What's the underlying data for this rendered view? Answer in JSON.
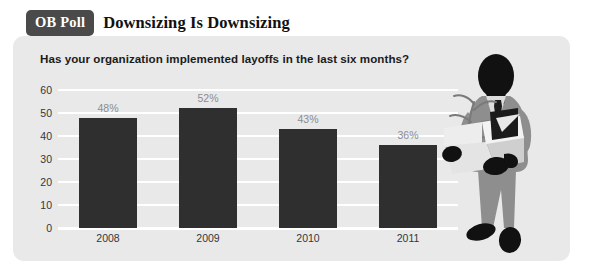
{
  "header": {
    "badge_label": "OB Poll",
    "headline": "Downsizing Is Downsizing"
  },
  "panel": {
    "question": "Has your organization implemented layoffs in the last six months?"
  },
  "illustration": {
    "name": "laid-off-employee-carrying-box-illustration",
    "colors": {
      "suit": "#8e8e8e",
      "silhouette": "#111111",
      "box": "#e0e0e0",
      "box_shadow": "#bdbdbd",
      "plant": "#7a7a7a"
    }
  },
  "colors": {
    "panel_background": "#e9e9e9",
    "bar": "#2f2f2f",
    "badge": "#4a4a4a",
    "gridline": "#ffffff",
    "value_label": "#8b8d92",
    "axis_label": "#33363b"
  },
  "chart_data": {
    "type": "bar",
    "title": "Has your organization implemented layoffs in the last six months?",
    "categories": [
      "2008",
      "2009",
      "2010",
      "2011"
    ],
    "values": [
      48,
      52,
      43,
      36
    ],
    "value_labels": [
      "48%",
      "52%",
      "43%",
      "36%"
    ],
    "xlabel": "",
    "ylabel": "",
    "ylim": [
      0,
      60
    ],
    "yticks": [
      0,
      10,
      20,
      30,
      40,
      50,
      60
    ],
    "ytick_labels": [
      "0",
      "10",
      "20",
      "30",
      "40",
      "50",
      "60"
    ],
    "grid": true,
    "legend": false
  }
}
